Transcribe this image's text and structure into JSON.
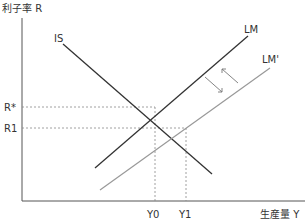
{
  "diagram": {
    "y_axis_label": "利子率 R",
    "x_axis_label": "生産量 Y",
    "curves": {
      "is": {
        "label": "IS",
        "color": "#333333"
      },
      "lm": {
        "label": "LM",
        "color": "#333333"
      },
      "lm_prime": {
        "label": "LM'",
        "color": "#999999"
      }
    },
    "y_ticks": {
      "r_star": "R*",
      "r1": "R1"
    },
    "x_ticks": {
      "y0": "Y0",
      "y1": "Y1"
    },
    "arrows": {
      "shift_direction": "LM to LM' (rightward shift, bidirectional arrows)"
    }
  }
}
